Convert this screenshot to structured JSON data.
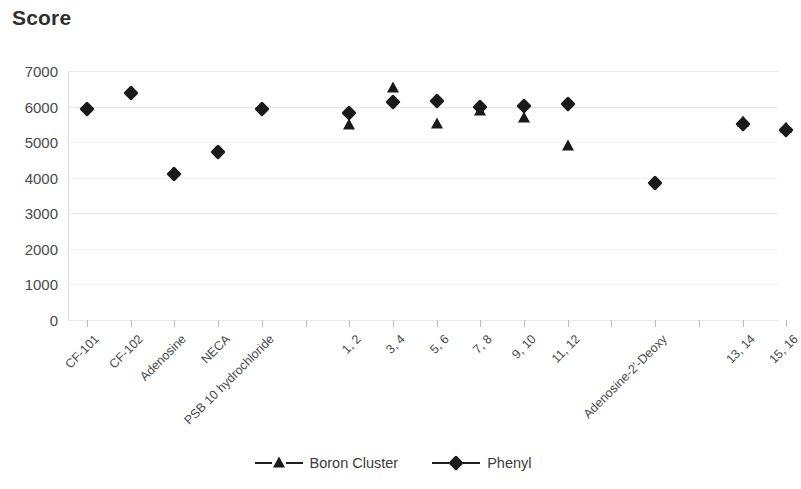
{
  "chart_data": {
    "type": "scatter",
    "title": "Score",
    "xlabel": "",
    "ylabel": "Score",
    "ylim": [
      0,
      7000
    ],
    "ytick_step": 1000,
    "yticks": [
      "7000",
      "6000",
      "5000",
      "4000",
      "3000",
      "2000",
      "1000",
      "0"
    ],
    "grid": true,
    "legend_position": "bottom-center",
    "categories": [
      "CF-101",
      "CF-102",
      "Adenosine",
      "NECA",
      "PSB 10 hydrochloride",
      "",
      "1, 2",
      "3, 4",
      "5, 6",
      "7, 8",
      "9, 10",
      "11, 12",
      "",
      "Adenosine-2'-Deoxy",
      "",
      "13, 14",
      "15, 16"
    ],
    "series": [
      {
        "name": "Boron Cluster",
        "marker": "triangle",
        "color": "#1a1a1a",
        "values": [
          null,
          null,
          null,
          null,
          null,
          null,
          5480,
          6520,
          5520,
          5880,
          5680,
          4900,
          null,
          null,
          null,
          5560,
          5400
        ]
      },
      {
        "name": "Phenyl",
        "marker": "diamond",
        "color": "#1a1a1a",
        "values": [
          5930,
          6380,
          4100,
          4720,
          5930,
          null,
          5830,
          6120,
          6170,
          6000,
          6030,
          6080,
          null,
          3850,
          null,
          5520,
          5330
        ]
      }
    ]
  },
  "legend": {
    "items": [
      {
        "label": "Boron Cluster",
        "marker": "triangle"
      },
      {
        "label": "Phenyl",
        "marker": "diamond"
      }
    ]
  },
  "colors": {
    "marker": "#1a1a1a",
    "grid": "#e6e6e6",
    "axis": "#d0d0d0",
    "text": "#3b3b3b"
  }
}
